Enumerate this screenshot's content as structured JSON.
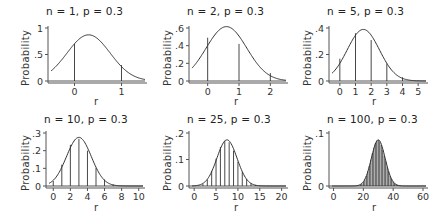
{
  "chart_data": [
    {
      "type": "line",
      "title": "n = 1, p = 0.3",
      "n": 1,
      "p": 0.3,
      "xlabel": "r",
      "ylabel": "Probability",
      "xlim": [
        -0.5,
        1.5
      ],
      "ylim": [
        0,
        1
      ],
      "xticks": [
        0,
        1
      ],
      "xtick_labels": [
        "0",
        "1"
      ],
      "yticks": [
        0,
        0.5,
        1
      ],
      "ytick_labels": [
        "0",
        ".5",
        "1"
      ],
      "bars": {
        "r": [
          0,
          1
        ],
        "probability": [
          0.7,
          0.3
        ]
      },
      "curve": {
        "label": "normal approximation",
        "mean": 0.3,
        "sd": 0.458
      }
    },
    {
      "type": "line",
      "title": "n = 2, p = 0.3",
      "n": 2,
      "p": 0.3,
      "xlabel": "r",
      "ylabel": "Probability",
      "xlim": [
        -0.5,
        2.5
      ],
      "ylim": [
        0,
        0.6
      ],
      "xticks": [
        0,
        1,
        2
      ],
      "xtick_labels": [
        "0",
        "1",
        "2"
      ],
      "yticks": [
        0,
        0.2,
        0.4,
        0.6
      ],
      "ytick_labels": [
        "0",
        ".2",
        ".4",
        ".6"
      ],
      "bars": {
        "r": [
          0,
          1,
          2
        ],
        "probability": [
          0.49,
          0.42,
          0.09
        ]
      },
      "curve": {
        "label": "normal approximation",
        "mean": 0.6,
        "sd": 0.648
      }
    },
    {
      "type": "line",
      "title": "n = 5, p = 0.3",
      "n": 5,
      "p": 0.3,
      "xlabel": "r",
      "ylabel": "Probability",
      "xlim": [
        -0.5,
        5.5
      ],
      "ylim": [
        0,
        0.4
      ],
      "xticks": [
        0,
        1,
        2,
        3,
        4,
        5
      ],
      "xtick_labels": [
        "0",
        "1",
        "2",
        "3",
        "4",
        "5"
      ],
      "yticks": [
        0,
        0.2,
        0.4
      ],
      "ytick_labels": [
        "0",
        ".2",
        ".4"
      ],
      "bars": {
        "r": [
          0,
          1,
          2,
          3,
          4,
          5
        ],
        "probability": [
          0.168,
          0.36,
          0.309,
          0.132,
          0.028,
          0.002
        ]
      },
      "curve": {
        "label": "normal approximation",
        "mean": 1.5,
        "sd": 1.025
      }
    },
    {
      "type": "line",
      "title": "n = 10, p = 0.3",
      "n": 10,
      "p": 0.3,
      "xlabel": "r",
      "ylabel": "Probability",
      "xlim": [
        -0.5,
        10.5
      ],
      "ylim": [
        0,
        0.3
      ],
      "xticks": [
        0,
        2,
        4,
        6,
        8,
        10
      ],
      "xtick_labels": [
        "0",
        "2",
        "4",
        "6",
        "8",
        "10"
      ],
      "yticks": [
        0,
        0.1,
        0.2,
        0.3
      ],
      "ytick_labels": [
        "0",
        ".1",
        ".2",
        ".3"
      ],
      "bars": {
        "r": [
          0,
          1,
          2,
          3,
          4,
          5,
          6,
          7,
          8,
          9,
          10
        ],
        "probability": [
          0.028,
          0.121,
          0.233,
          0.267,
          0.2,
          0.103,
          0.037,
          0.009,
          0.001,
          0.0,
          0.0
        ]
      },
      "curve": {
        "label": "normal approximation",
        "mean": 3.0,
        "sd": 1.449
      }
    },
    {
      "type": "line",
      "title": "n = 25, p = 0.3",
      "n": 25,
      "p": 0.3,
      "xlabel": "r",
      "ylabel": "Probability",
      "xlim": [
        -0.5,
        21
      ],
      "ylim": [
        0,
        0.2
      ],
      "xticks": [
        0,
        5,
        10,
        15,
        20
      ],
      "xtick_labels": [
        "0",
        "5",
        "10",
        "15",
        "20"
      ],
      "yticks": [
        0,
        0.1,
        0.2
      ],
      "ytick_labels": [
        "0",
        ".1",
        ".2"
      ],
      "bars": {
        "r": [
          0,
          1,
          2,
          3,
          4,
          5,
          6,
          7,
          8,
          9,
          10,
          11,
          12,
          13,
          14,
          15,
          16,
          17,
          18,
          19,
          20
        ],
        "probability": [
          0.0001,
          0.0014,
          0.0074,
          0.0243,
          0.0572,
          0.103,
          0.1472,
          0.1712,
          0.1651,
          0.1336,
          0.0916,
          0.0536,
          0.0268,
          0.0115,
          0.0042,
          0.0013,
          0.0004,
          0.0001,
          0.0,
          0.0,
          0.0
        ]
      },
      "curve": {
        "label": "normal approximation",
        "mean": 7.5,
        "sd": 2.291
      }
    },
    {
      "type": "line",
      "title": "n = 100, p = 0.3",
      "n": 100,
      "p": 0.3,
      "xlabel": "r",
      "ylabel": "Probability",
      "xlim": [
        -1,
        62
      ],
      "ylim": [
        0,
        0.1
      ],
      "xticks": [
        0,
        20,
        40,
        60
      ],
      "xtick_labels": [
        "0",
        "20",
        "40",
        "60"
      ],
      "yticks": [
        0,
        0.1
      ],
      "ytick_labels": [
        "0",
        ".1"
      ],
      "bars": {
        "r_range": [
          15,
          45
        ],
        "description": "binomial(100, 0.3) pmf from r=15 to 45"
      },
      "curve": {
        "label": "normal approximation",
        "mean": 30,
        "sd": 4.583
      }
    }
  ],
  "colors": {
    "axis": "#555555",
    "curve": "#333333",
    "bar": "#333333",
    "text": "#222222"
  }
}
